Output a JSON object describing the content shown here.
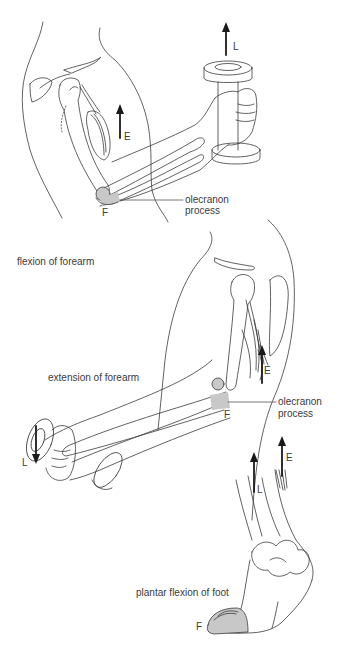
{
  "figure": {
    "panels": [
      {
        "id": "flexion",
        "caption": "flexion of forearm",
        "effort_label": "E",
        "load_label": "L",
        "fulcrum_label": "F",
        "callout": [
          "olecranon",
          "process"
        ]
      },
      {
        "id": "extension",
        "caption": "extension of forearm",
        "effort_label": "E",
        "load_label": "L",
        "fulcrum_label": "F",
        "callout": [
          "olecranon",
          "process"
        ]
      },
      {
        "id": "plantar",
        "caption": "plantar flexion of foot",
        "effort_label": "E",
        "load_label": "L",
        "fulcrum_label": "F"
      }
    ],
    "colors": {
      "line": "#3a3a3a",
      "arrow": "#1a1a1a",
      "fulcrum_shade": "#c8c8c8",
      "background": "#ffffff"
    }
  }
}
